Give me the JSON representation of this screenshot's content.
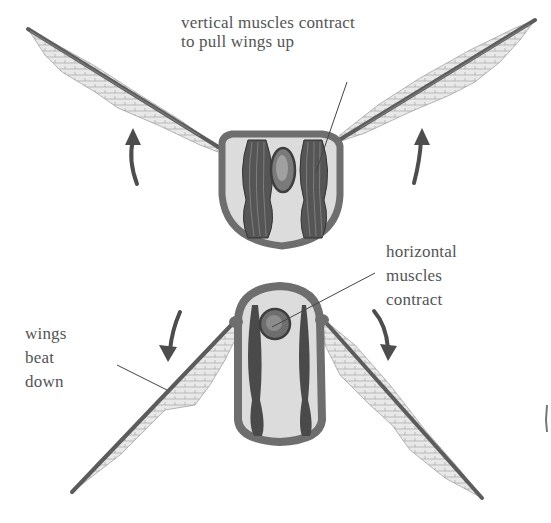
{
  "diagram": {
    "colors": {
      "background": "#ffffff",
      "body_outline": "#6b6b6b",
      "body_fill": "#dedede",
      "muscle": "#4a4a4a",
      "wing_vein": "#5a5a5a",
      "wing_membrane": "#e6e6e6",
      "arrow": "#4d4d4d",
      "leader_line": "#444444",
      "label_text": "#555555"
    },
    "upstroke": {
      "label_lines": [
        "vertical muscles contract",
        "to pull wings up"
      ],
      "arrows": [
        "up-left-arrow",
        "up-right-arrow"
      ]
    },
    "downstroke": {
      "muscle_label_lines": [
        "horizontal",
        "muscles",
        "contract"
      ],
      "wing_label_lines": [
        "wings",
        "beat",
        "down"
      ],
      "arrows": [
        "down-left-arrow",
        "down-right-arrow"
      ]
    }
  }
}
